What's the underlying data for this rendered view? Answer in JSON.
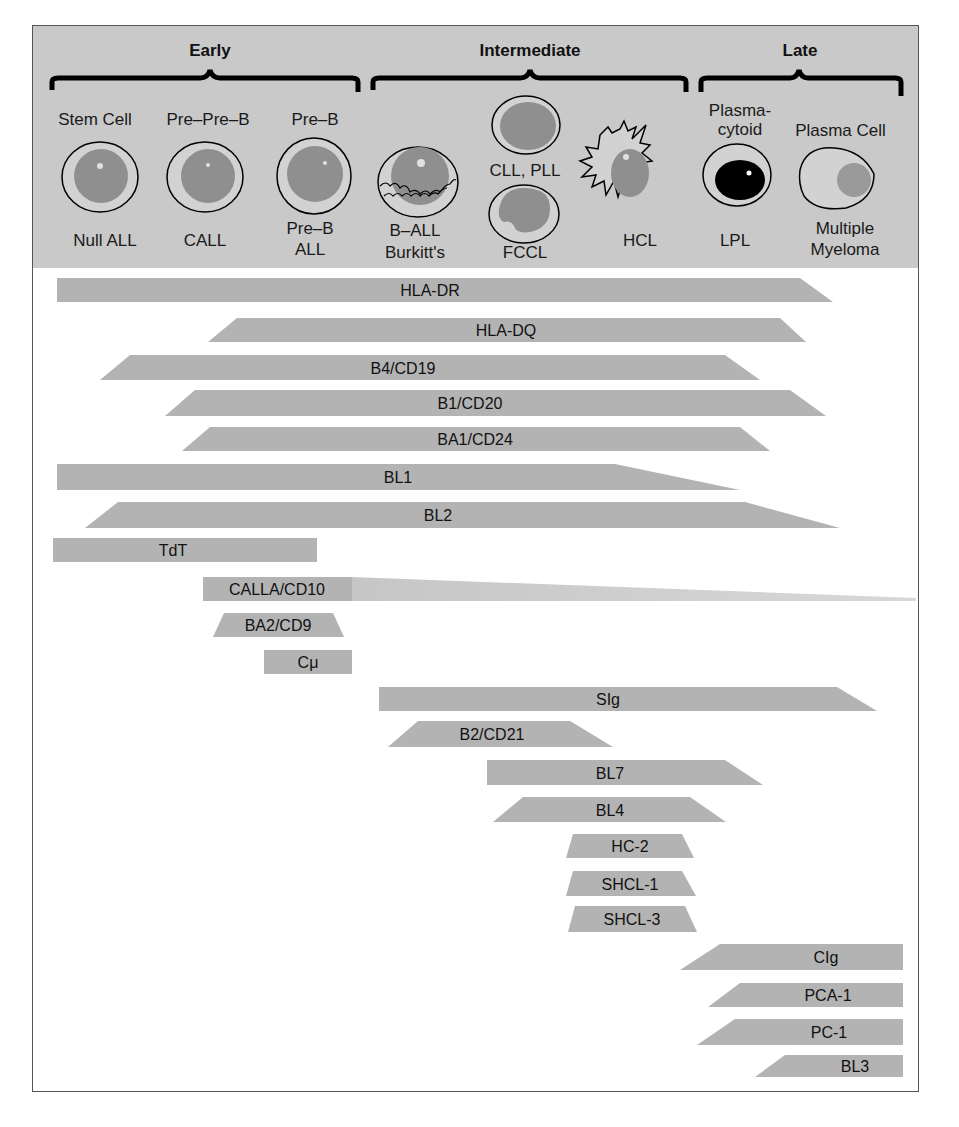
{
  "stages": [
    {
      "label": "Early",
      "x": 210
    },
    {
      "label": "Intermediate",
      "x": 530
    },
    {
      "label": "Late",
      "x": 799
    }
  ],
  "cells": [
    {
      "name": "Stem Cell",
      "disease": "Null ALL"
    },
    {
      "name": "Pre-Pre-B",
      "disease": "CALL"
    },
    {
      "name": "Pre-B",
      "disease": "Pre-B ALL"
    },
    {
      "name": "",
      "disease": "B-ALL Burkitt's"
    },
    {
      "name": "",
      "disease": "CLL, PLL"
    },
    {
      "name": "",
      "disease": "FCCL"
    },
    {
      "name": "",
      "disease": "HCL"
    },
    {
      "name": "Plasma-cytoid",
      "disease": "LPL"
    },
    {
      "name": "Plasma Cell",
      "disease": "Multiple Myeloma"
    }
  ],
  "labels": {
    "stem_cell": "Stem Cell",
    "pre_pre_b": "Pre–Pre–B",
    "pre_b": "Pre–B",
    "plasmacytoid_1": "Plasma-",
    "plasmacytoid_2": "cytoid",
    "plasma_cell": "Plasma Cell",
    "null_all": "Null ALL",
    "call": "CALL",
    "pre_b_all_1": "Pre–B",
    "pre_b_all_2": "ALL",
    "b_all_1": "B–ALL",
    "b_all_2": "Burkitt's",
    "cll_pll": "CLL, PLL",
    "fccl": "FCCL",
    "hcl": "HCL",
    "lpl": "LPL",
    "mm_1": "Multiple",
    "mm_2": "Myeloma"
  },
  "colors": {
    "header_bg": "#c9c9c9",
    "bar": "#b3b3b3",
    "nucleus": "#8f8f8f",
    "cytoplasm": "#d2d2d2"
  },
  "markers": [
    {
      "label": "HLA-DR",
      "poly": [
        57,
        278,
        800,
        278,
        833,
        302,
        57,
        302
      ],
      "lx": 430
    },
    {
      "label": "HLA-DQ",
      "poly": [
        237,
        318,
        780,
        318,
        806,
        342,
        208,
        342
      ],
      "lx": 506
    },
    {
      "label": "B4/CD19",
      "poly": [
        130,
        355,
        725,
        355,
        760,
        380,
        100,
        380
      ],
      "lx": 403
    },
    {
      "label": "B1/CD20",
      "poly": [
        195,
        390,
        790,
        390,
        826,
        416,
        165,
        416
      ],
      "lx": 470
    },
    {
      "label": "BA1/CD24",
      "poly": [
        210,
        427,
        740,
        427,
        770,
        451,
        182,
        451
      ],
      "lx": 475
    },
    {
      "label": "BL1",
      "poly": [
        57,
        464,
        615,
        464,
        740,
        490,
        57,
        490
      ],
      "lx": 398
    },
    {
      "label": "BL2",
      "poly": [
        118,
        502,
        745,
        502,
        840,
        528,
        85,
        528
      ],
      "lx": 438
    },
    {
      "label": "TdT",
      "poly": [
        53,
        538,
        317,
        538,
        317,
        562,
        53,
        562
      ],
      "lx": 173
    },
    {
      "label": "CALLA/CD10",
      "poly": [
        203,
        577,
        352,
        577,
        352,
        601,
        203,
        601
      ],
      "lx": 277
    },
    {
      "label": "BA2/CD9",
      "poly": [
        224,
        613,
        333,
        613,
        344,
        637,
        213,
        637
      ],
      "lx": 278
    },
    {
      "label": "Cμ",
      "poly": [
        264,
        650,
        352,
        650,
        352,
        674,
        264,
        674
      ],
      "lx": 308
    },
    {
      "label": "SIg",
      "poly": [
        379,
        687,
        837,
        687,
        877,
        711,
        379,
        711
      ],
      "lx": 608
    },
    {
      "label": "B2/CD21",
      "poly": [
        418,
        721,
        570,
        721,
        613,
        747,
        388,
        747
      ],
      "lx": 492
    },
    {
      "label": "BL7",
      "poly": [
        487,
        760,
        725,
        760,
        763,
        785,
        487,
        785
      ],
      "lx": 610
    },
    {
      "label": "BL4",
      "poly": [
        523,
        797,
        690,
        797,
        726,
        822,
        493,
        822
      ],
      "lx": 610
    },
    {
      "label": "HC-2",
      "poly": [
        573,
        834,
        682,
        834,
        694,
        858,
        566,
        858
      ],
      "lx": 630
    },
    {
      "label": "SHCL-1",
      "poly": [
        573,
        871,
        682,
        871,
        696,
        896,
        566,
        896
      ],
      "lx": 630
    },
    {
      "label": "SHCL-3",
      "poly": [
        575,
        906,
        685,
        906,
        697,
        932,
        568,
        932
      ],
      "lx": 632
    },
    {
      "label": "CIg",
      "poly": [
        720,
        944,
        903,
        944,
        903,
        970,
        680,
        970
      ],
      "lx": 826
    },
    {
      "label": "PCA-1",
      "poly": [
        740,
        983,
        903,
        983,
        903,
        1007,
        708,
        1007
      ],
      "lx": 828
    },
    {
      "label": "PC-1",
      "poly": [
        735,
        1019,
        903,
        1019,
        903,
        1045,
        697,
        1045
      ],
      "lx": 829
    },
    {
      "label": "BL3",
      "poly": [
        785,
        1055,
        903,
        1055,
        903,
        1077,
        755,
        1077
      ],
      "lx": 855
    }
  ],
  "calla_fade": {
    "poly": [
      352,
      577,
      916,
      598,
      916,
      601,
      352,
      601
    ]
  }
}
